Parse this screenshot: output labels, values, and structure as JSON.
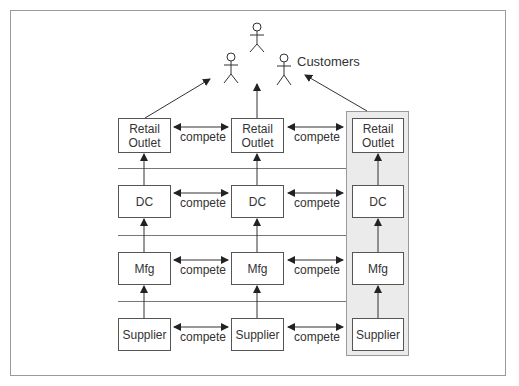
{
  "diagram": {
    "customers_label": "Customers",
    "columns": [
      {
        "highlighted": false,
        "tiers": [
          "Retail Outlet",
          "DC",
          "Mfg",
          "Supplier"
        ]
      },
      {
        "highlighted": false,
        "tiers": [
          "Retail Outlet",
          "DC",
          "Mfg",
          "Supplier"
        ]
      },
      {
        "highlighted": true,
        "tiers": [
          "Retail Outlet",
          "DC",
          "Mfg",
          "Supplier"
        ]
      }
    ],
    "tier_labels": {
      "retail_line1": "Retail",
      "retail_line2": "Outlet",
      "dc": "DC",
      "mfg": "Mfg",
      "supplier": "Supplier"
    },
    "compete_label": "compete",
    "customer_figures": 3,
    "colors": {
      "highlight_fill": "#ebebeb",
      "line": "#333333",
      "frame": "#9a9a9a"
    }
  }
}
